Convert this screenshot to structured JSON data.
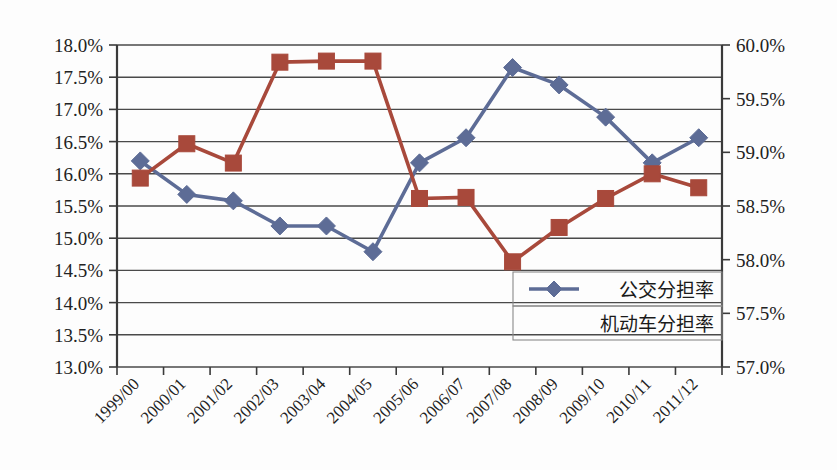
{
  "chart_data": {
    "type": "line",
    "title": "",
    "subtitle": "",
    "xlabel": "",
    "ylabel": "",
    "grid": true,
    "legend_position": "inside-bottom-right",
    "categories": [
      "1999/00",
      "2000/01",
      "2001/02",
      "2002/03",
      "2003/04",
      "2004/05",
      "2005/06",
      "2006/07",
      "2007/08",
      "2008/09",
      "2009/10",
      "2010/11",
      "2011/12"
    ],
    "axes": {
      "left": {
        "label": "",
        "ylim": [
          13.0,
          18.0
        ],
        "tick_step": 0.5,
        "ticks": [
          "18.0%",
          "17.5%",
          "17.0%",
          "16.5%",
          "16.0%",
          "15.5%",
          "15.0%",
          "14.5%",
          "14.0%",
          "13.5%",
          "13.0%"
        ],
        "tick_values": [
          18.0,
          17.5,
          17.0,
          16.5,
          16.0,
          15.5,
          15.0,
          14.5,
          14.0,
          13.5,
          13.0
        ]
      },
      "right": {
        "label": "",
        "ylim": [
          57.0,
          60.0
        ],
        "tick_step": 0.5,
        "ticks": [
          "60.0%",
          "59.5%",
          "59.0%",
          "58.5%",
          "58.0%",
          "57.5%",
          "57.0%"
        ],
        "tick_values": [
          60.0,
          59.5,
          59.0,
          58.5,
          58.0,
          57.5,
          57.0
        ]
      }
    },
    "series": [
      {
        "name": "公交分担率",
        "axis": "left",
        "color": "#5d6c96",
        "marker": "diamond",
        "values": [
          16.2,
          15.68,
          15.58,
          15.19,
          15.19,
          14.79,
          16.17,
          16.56,
          17.65,
          17.38,
          16.88,
          16.17,
          16.56
        ]
      },
      {
        "name": "机动车分担率",
        "axis": "right",
        "color": "#a8493b",
        "marker": "square",
        "values": [
          58.76,
          59.08,
          58.9,
          59.84,
          59.85,
          59.85,
          58.57,
          58.58,
          57.98,
          58.3,
          58.57,
          58.8,
          58.67
        ]
      }
    ],
    "legend": [
      {
        "label": "公交分担率",
        "color": "#5d6c96",
        "marker": "diamond",
        "has_marker": true
      },
      {
        "label": "机动车分担率",
        "color": "#a8493b",
        "marker": "none",
        "has_marker": false
      }
    ],
    "colors": {
      "blue_series": "#5d6c96",
      "red_series": "#a8493b",
      "gridline": "#4a4a4a",
      "axis": "#3a3a3a",
      "background": "#fdfdfd",
      "text": "#222222"
    }
  }
}
